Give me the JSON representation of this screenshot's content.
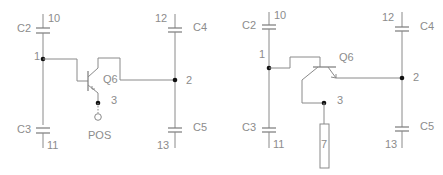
{
  "colors": {
    "wire": "#8a8a8a",
    "label": "#8c8c8c",
    "node_dot": "#111111",
    "background": "#ffffff"
  },
  "left_circuit": {
    "caps": {
      "c2": "C2",
      "c3": "C3",
      "c4": "C4",
      "c5": "C5"
    },
    "pins": {
      "c2_top": "10",
      "c3_bottom": "11",
      "c4_top": "12",
      "c5_bottom": "13"
    },
    "nodes": {
      "n1": "1",
      "n2": "2",
      "n3": "3"
    },
    "transistor": "Q6",
    "terminal": "POS"
  },
  "right_circuit": {
    "caps": {
      "c2": "C2",
      "c3": "C3",
      "c4": "C4",
      "c5": "C5"
    },
    "pins": {
      "c2_top": "10",
      "c3_bottom": "11",
      "c4_top": "12",
      "c5_bottom": "13"
    },
    "nodes": {
      "n1": "1",
      "n2": "2",
      "n3": "3"
    },
    "transistor": "Q6",
    "probe_box": "7"
  }
}
